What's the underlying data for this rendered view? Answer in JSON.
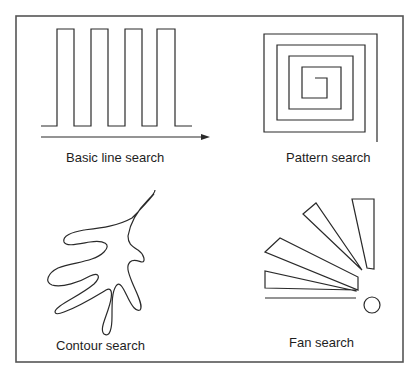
{
  "diagram": {
    "colors": {
      "stroke": "#2a2a2a",
      "frame": "#555555",
      "background": "#ffffff",
      "text": "#1e1e1e"
    },
    "panels": [
      {
        "id": "basic-line",
        "label": "Basic line search",
        "shape": "square-wave-with-arrow"
      },
      {
        "id": "pattern",
        "label": "Pattern search",
        "shape": "square-spiral"
      },
      {
        "id": "contour",
        "label": "Contour search",
        "shape": "leaf-contour"
      },
      {
        "id": "fan",
        "label": "Fan search",
        "shape": "fan-wedges-with-circle"
      }
    ]
  }
}
